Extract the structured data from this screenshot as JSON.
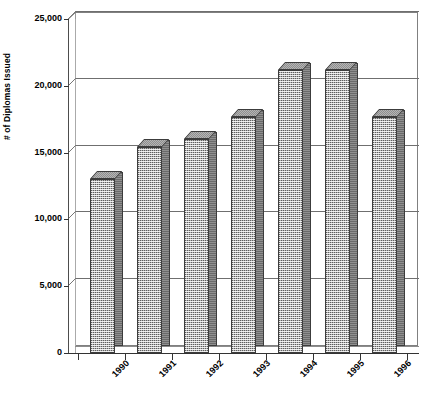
{
  "chart_data": {
    "type": "bar",
    "title": "",
    "subtitle": "",
    "xlabel": "",
    "ylabel": "# of Diplomas Issued",
    "categories": [
      "1990",
      "1991",
      "1992",
      "1993",
      "1994",
      "1995",
      "1996"
    ],
    "values": [
      13000,
      15400,
      16000,
      17700,
      21200,
      21200,
      17700
    ],
    "series": [
      {
        "name": "# of Diplomas Issued",
        "values": [
          13000,
          15400,
          16000,
          17700,
          21200,
          21200,
          17700
        ]
      }
    ],
    "ylim": [
      0,
      25000
    ],
    "y_ticks": [
      0,
      5000,
      10000,
      15000,
      20000,
      25000
    ],
    "y_tick_labels": [
      "0",
      "5,000",
      "10,000",
      "15,000",
      "20,000",
      "25,000"
    ],
    "grid": true,
    "grid_axis": "y",
    "legend": false,
    "legend_position": "none",
    "style": "3d-column",
    "bar_fill_color": "#b4b4b4",
    "bar_side_color": "#6a6a6a",
    "bar_top_color": "#8e8e8e",
    "bar_outline_color": "#3c3c3c",
    "grid_color": "#6f6f6f",
    "axis_color": "#333333",
    "background_color": "#ffffff",
    "text_color": "#000000",
    "x_tick_label_rotation": -45,
    "y_axis_title_rotation": -90,
    "data_labels_shown": false
  }
}
